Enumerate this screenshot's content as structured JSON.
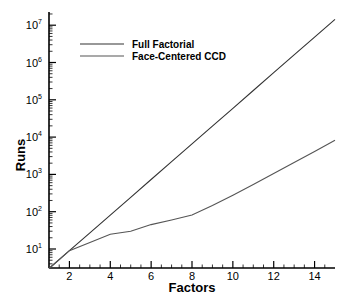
{
  "chart_data": {
    "type": "line",
    "title": "",
    "xlabel": "Factors",
    "ylabel": "Runs",
    "x_scale": "linear",
    "y_scale": "log",
    "xlim": [
      1,
      15
    ],
    "ylim": [
      3,
      15000000
    ],
    "x_ticks": [
      2,
      4,
      6,
      8,
      10,
      12,
      14
    ],
    "x_tick_labels": [
      "2",
      "4",
      "6",
      "8",
      "10",
      "12",
      "14"
    ],
    "y_ticks": [
      10,
      100,
      1000,
      10000,
      100000,
      1000000,
      10000000
    ],
    "y_tick_labels": [
      "10^1",
      "10^2",
      "10^3",
      "10^4",
      "10^5",
      "10^6",
      "10^7"
    ],
    "grid": false,
    "legend_position": "upper-left",
    "x": [
      1,
      2,
      3,
      4,
      5,
      6,
      7,
      8,
      9,
      10,
      11,
      12,
      13,
      14,
      15
    ],
    "series": [
      {
        "name": "Full Factorial",
        "color": "#333333",
        "values": [
          3,
          9,
          27,
          81,
          243,
          729,
          2187,
          6561,
          19683,
          59049,
          177147,
          531441,
          1594323,
          4782969,
          14348907
        ]
      },
      {
        "name": "Face-Centered CCD",
        "color": "#555555",
        "values": [
          3,
          9,
          15,
          25,
          30,
          45,
          60,
          81,
          147,
          277,
          535,
          1049,
          2075,
          4125,
          8223
        ]
      }
    ]
  },
  "legend": {
    "items": [
      {
        "label": "Full Factorial"
      },
      {
        "label": "Face-Centered CCD"
      }
    ]
  },
  "axes": {
    "x_title": "Factors",
    "y_title": "Runs"
  }
}
